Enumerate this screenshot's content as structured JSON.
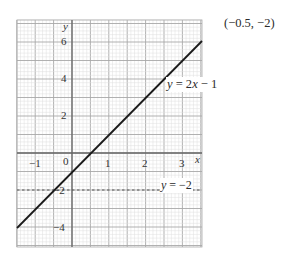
{
  "chart_data": {
    "type": "line",
    "title": "",
    "xlabel": "x",
    "ylabel": "y",
    "xlim": [
      -1.5,
      3.5
    ],
    "ylim": [
      -5.1,
      7.2
    ],
    "grid": true,
    "x_ticks": [
      "-1",
      "0",
      "1",
      "2",
      "3"
    ],
    "y_ticks": [
      "6",
      "4",
      "2",
      "-2",
      "-4"
    ],
    "series": [
      {
        "name": "y = 2x − 1",
        "style": "solid",
        "x": [
          -1.5,
          3.5
        ],
        "y": [
          -4,
          6
        ]
      },
      {
        "name": "y = −2",
        "style": "dashed",
        "x": [
          -1.5,
          3.5
        ],
        "y": [
          -2,
          -2
        ]
      }
    ],
    "annotations": [
      "(−0.5, −2)",
      "y = 2x − 1",
      "y = −2"
    ]
  },
  "labels": {
    "intersection": "(−0.5, −2)",
    "line1_y": "y",
    "line1_rest": " = 2",
    "line1_x": "x",
    "line1_tail": " − 1",
    "line2_y": "y",
    "line2_rest": " = −2",
    "axis_x": "x",
    "axis_y": "y",
    "tick_labels": {
      "xm1": "−1",
      "x0": "0",
      "x1": "1",
      "x2": "2",
      "x3": "3",
      "y6": "6",
      "y4": "4",
      "y2": "2",
      "ym2": "−2",
      "ym4": "−4"
    }
  }
}
